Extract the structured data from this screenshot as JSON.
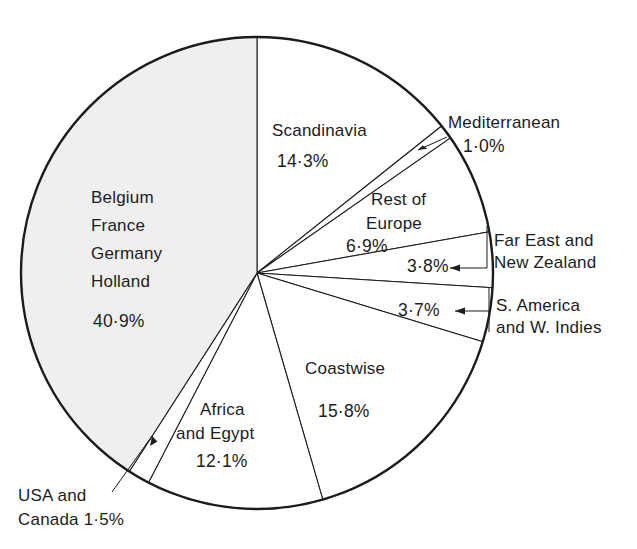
{
  "figure": {
    "background": "#ffffff",
    "outline_color": "#1c1c1c",
    "shaded_fill": "#efefef",
    "plain_fill": "#ffffff"
  },
  "chart_data": {
    "type": "pie",
    "title": "",
    "subtitle": "",
    "xlabel": "",
    "ylabel": "",
    "legend_position": "none",
    "grid": false,
    "units": "percent",
    "decimal_separator": "·",
    "start_angle_deg": 0,
    "direction": "clockwise",
    "total": 100.0,
    "categories": [
      "Scandinavia",
      "Mediterranean",
      "Rest of Europe",
      "Far East and New Zealand",
      "S. America and W. Indies",
      "Coastwise",
      "Africa and Egypt",
      "USA and Canada",
      "Belgium France Germany Holland"
    ],
    "values": [
      14.3,
      1.0,
      6.9,
      3.8,
      3.7,
      15.8,
      12.1,
      1.5,
      40.9
    ],
    "slices": [
      {
        "id": "scandinavia",
        "name": "Scandinavia",
        "value": 14.3,
        "value_text": "14·3%",
        "name_lines": [
          "Scandinavia"
        ],
        "fill": "#ffffff",
        "label_placement": "inside",
        "label_x": 332,
        "label_y": 130,
        "pct_x": 290,
        "pct_y": 156,
        "leader": false
      },
      {
        "id": "mediterranean",
        "name": "Mediterranean",
        "value": 1.0,
        "value_text": "1·0%",
        "name_lines": [
          "Mediterranean"
        ],
        "fill": "#ffffff",
        "label_placement": "outside",
        "label_x": 449,
        "label_y": 128,
        "pct_x": 455,
        "pct_y": 150,
        "leader": true
      },
      {
        "id": "rest-of-europe",
        "name": "Rest of Europe",
        "value": 6.9,
        "value_text": "6·9%",
        "name_lines": [
          "Rest of",
          "Europe"
        ],
        "fill": "#ffffff",
        "label_placement": "inside",
        "label_x": 386,
        "label_y": 205,
        "pct_x": 363,
        "pct_y": 252,
        "leader": false
      },
      {
        "id": "far-east-new-zealand",
        "name": "Far East and New Zealand",
        "value": 3.8,
        "value_text": "3·8%",
        "name_lines": [
          "Far East and",
          "New Zealand"
        ],
        "fill": "#ffffff",
        "label_placement": "outside",
        "label_x": 492,
        "label_y": 246,
        "pct_x": 416,
        "pct_y": 268,
        "leader": true
      },
      {
        "id": "s-america-w-indies",
        "name": "S. America and W. Indies",
        "value": 3.7,
        "value_text": "3·7%",
        "name_lines": [
          "S. America",
          "and W. Indies"
        ],
        "fill": "#ffffff",
        "label_placement": "outside",
        "label_x": 494,
        "label_y": 308,
        "pct_x": 403,
        "pct_y": 312,
        "leader": true
      },
      {
        "id": "coastwise",
        "name": "Coastwise",
        "value": 15.8,
        "value_text": "15·8%",
        "name_lines": [
          "Coastwise"
        ],
        "fill": "#ffffff",
        "label_placement": "inside",
        "label_x": 340,
        "label_y": 374,
        "pct_x": 343,
        "pct_y": 411,
        "leader": false
      },
      {
        "id": "africa-and-egypt",
        "name": "Africa and Egypt",
        "value": 12.1,
        "value_text": "12·1%",
        "name_lines": [
          "Africa",
          "and Egypt"
        ],
        "fill": "#ffffff",
        "label_placement": "inside",
        "label_x": 229,
        "label_y": 412,
        "pct_x": 231,
        "pct_y": 461,
        "leader": false
      },
      {
        "id": "usa-and-canada",
        "name": "USA and Canada",
        "value": 1.5,
        "value_text": "1·5%",
        "name_lines": [
          "USA and",
          "Canada 1·5%"
        ],
        "fill": "#ffffff",
        "label_placement": "outside",
        "label_x": 38,
        "label_y": 499,
        "pct_x": 0,
        "pct_y": 0,
        "leader": true
      },
      {
        "id": "belgium-france-germany-holland",
        "name": "Belgium France Germany Holland",
        "value": 40.9,
        "value_text": "40·9%",
        "name_lines": [
          "Belgium",
          "France",
          "Germany",
          "Holland"
        ],
        "fill": "#efefef",
        "label_placement": "inside",
        "label_x": 91,
        "label_y": 196,
        "pct_x": 93,
        "pct_y": 290,
        "leader": false
      }
    ]
  },
  "labels": {
    "scandinavia_name": "Scandinavia",
    "scandinavia_pct": "14·3%",
    "mediterranean_name": "Mediterranean",
    "mediterranean_pct": "1·0%",
    "rest_of_europe_l1": "Rest of",
    "rest_of_europe_l2": "Europe",
    "rest_of_europe_pct": "6·9%",
    "far_east_l1": "Far East and",
    "far_east_l2": "New Zealand",
    "far_east_pct": "3·8%",
    "s_america_l1": "S. America",
    "s_america_l2": "and W. Indies",
    "s_america_pct": "3·7%",
    "coastwise_name": "Coastwise",
    "coastwise_pct": "15·8%",
    "africa_l1": "Africa",
    "africa_l2": "and Egypt",
    "africa_pct": "12·1%",
    "usa_l1": "USA and",
    "usa_l2": "Canada 1·5%",
    "belgium_l1": "Belgium",
    "belgium_l2": "France",
    "belgium_l3": "Germany",
    "belgium_l4": "Holland",
    "belgium_pct": "40·9%"
  }
}
